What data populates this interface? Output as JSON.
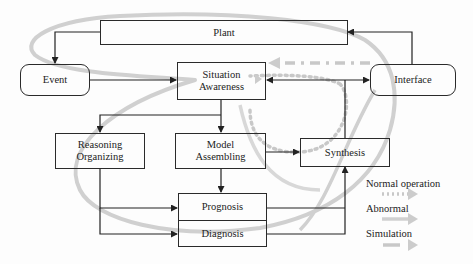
{
  "diagram": {
    "nodes": {
      "plant": {
        "label": "Plant"
      },
      "event": {
        "label": "Event"
      },
      "situation_awareness": {
        "line1": "Situation",
        "line2": "Awareness"
      },
      "interface": {
        "label": "Interface"
      },
      "reasoning_organizing": {
        "line1": "Reasoning",
        "line2": "Organizing"
      },
      "model_assembling": {
        "line1": "Model",
        "line2": "Assembling"
      },
      "synthesis": {
        "label": "Synthesis"
      },
      "prognosis": {
        "label": "Prognosis"
      },
      "diagnosis": {
        "label": "Diagnosis"
      }
    },
    "edges": [
      {
        "from": "Plant",
        "to": "Event"
      },
      {
        "from": "Event",
        "to": "Situation Awareness"
      },
      {
        "from": "Interface",
        "to": "Plant"
      },
      {
        "from": "Situation Awareness",
        "to": "Interface",
        "bidirectional": true
      },
      {
        "from": "Situation Awareness",
        "to": "Reasoning Organizing"
      },
      {
        "from": "Situation Awareness",
        "to": "Model Assembling"
      },
      {
        "from": "Model Assembling",
        "to": "Synthesis"
      },
      {
        "from": "Model Assembling",
        "to": "Prognosis"
      },
      {
        "from": "Reasoning Organizing",
        "to": "Prognosis"
      },
      {
        "from": "Reasoning Organizing",
        "to": "Diagnosis"
      },
      {
        "from": "Prognosis",
        "to": "Synthesis"
      },
      {
        "from": "Diagnosis",
        "to": "Synthesis"
      },
      {
        "from": "Synthesis",
        "to": "Interface"
      }
    ],
    "legend": [
      {
        "label": "Normal operation",
        "style": "dotted"
      },
      {
        "label": "Abnormal",
        "style": "solid"
      },
      {
        "label": "Simulation",
        "style": "dashed"
      }
    ],
    "colors": {
      "box_stroke": "#2a2a2a",
      "flow_gray": "#c8c8c8"
    }
  }
}
